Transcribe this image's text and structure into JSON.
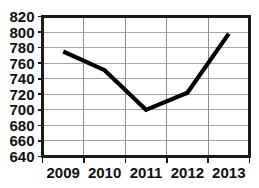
{
  "chart_data": {
    "type": "line",
    "title": "",
    "subtitle": "",
    "xlabel": "",
    "ylabel": "",
    "categories": [
      "2009",
      "2010",
      "2011",
      "2012",
      "2013"
    ],
    "values": [
      775,
      751,
      700,
      722,
      798
    ],
    "series": [
      {
        "name": "",
        "values": [
          775,
          751,
          700,
          722,
          798
        ]
      }
    ],
    "ylim": [
      640,
      820
    ],
    "ytick_step": 20,
    "ytick_labels": [
      "820",
      "800",
      "780",
      "760",
      "740",
      "720",
      "700",
      "680",
      "660",
      "640"
    ],
    "ytick_values": [
      820,
      800,
      780,
      760,
      740,
      720,
      700,
      680,
      660,
      640
    ],
    "xtick_labels": [
      "2009",
      "2010",
      "2011",
      "2012",
      "2013"
    ],
    "grid": true,
    "grid_horizontal": true,
    "grid_vertical": true,
    "legend": false,
    "legend_position": "none",
    "annotations": [],
    "colors": {
      "line": "#000000",
      "grid": "#9a9a9a",
      "frame": "#1a1a1a",
      "background": "#ffffff",
      "text": "#101010"
    }
  },
  "axes": {
    "y_axis_name": "y-axis",
    "x_axis_name": "x-axis"
  }
}
